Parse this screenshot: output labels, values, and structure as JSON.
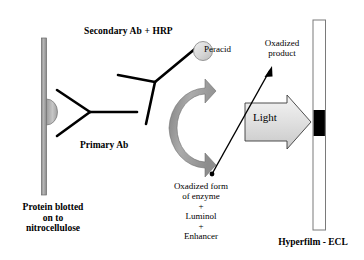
{
  "figure": {
    "labels": {
      "secondary_ab": "Secondary Ab + HRP",
      "peracid": "Peracid",
      "oxidized_product": "Oxadized\nproduct",
      "primary_ab": "Primary Ab",
      "light": "Light",
      "oxidized_enzyme": "Oxadized form\nof enzyme\n+\nLuminol\n+\nEnhancer",
      "protein_blotted": "Protein blotted\non to\nnitrocellulose",
      "hyperfilm": "Hyperfilm - ECL"
    },
    "colors": {
      "stroke": "#000000",
      "membrane_fill": "#9a9a9a",
      "membrane_edge": "#6d6d6d",
      "antigen_fill": "#b5b5b5",
      "hrp_fill": "#d8d8d8",
      "curved_arrow_fill": "#9e9e9e",
      "light_arrow_fill": "#dcdcdc",
      "film_band": "#000000",
      "film_edge": "#7a7a7a",
      "background": "#ffffff"
    }
  }
}
